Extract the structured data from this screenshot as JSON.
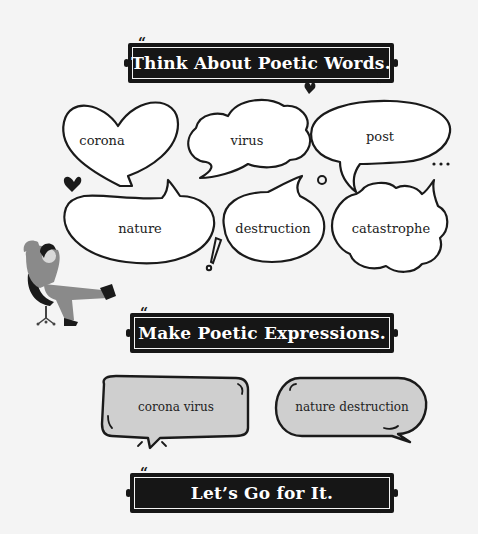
{
  "sections": {
    "think": {
      "title": "Think About Poetic Words."
    },
    "make": {
      "title": "Make Poetic Expressions."
    },
    "go": {
      "title": "Let’s Go for It."
    }
  },
  "quote_marks": {
    "open": "“",
    "close": "”"
  },
  "words": [
    {
      "label": "corona",
      "shape": "heart-bubble"
    },
    {
      "label": "virus",
      "shape": "cloud-bubble"
    },
    {
      "label": "post",
      "shape": "oval-bubble"
    },
    {
      "label": "nature",
      "shape": "bean-bubble"
    },
    {
      "label": "destruction",
      "shape": "round-bubble"
    },
    {
      "label": "catastrophe",
      "shape": "cloud-bubble"
    }
  ],
  "expressions": [
    {
      "label": "corona virus"
    },
    {
      "label": "nature destruction"
    }
  ],
  "decorations": {
    "ellipsis": "...",
    "exclamation": "!",
    "icons": [
      "heart-icon",
      "heart-icon",
      "circle-icon",
      "exclamation-icon",
      "ellipsis-icon",
      "person-in-chair-illustration"
    ]
  },
  "colors": {
    "background": "#f4f4f4",
    "banner": "#161616",
    "banner_text": "#ffffff",
    "outline": "#1a1a1a",
    "expression_fill": "#cfcfcf",
    "person_fill": "#8a8a8a"
  }
}
